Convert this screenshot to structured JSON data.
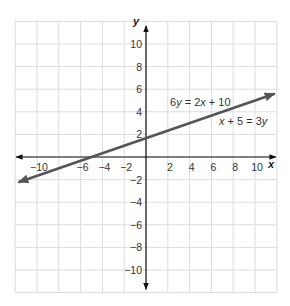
{
  "chart_data": {
    "type": "line",
    "title": "",
    "xlabel": "x",
    "ylabel": "y",
    "xlim": [
      -12,
      12
    ],
    "ylim": [
      -12,
      12
    ],
    "grid": true,
    "grid_step": 2,
    "x_ticks": [
      -10,
      -6,
      -4,
      -2,
      2,
      4,
      6,
      8,
      10
    ],
    "x_tick_labels": [
      "−10",
      "−6",
      "−4",
      "−2",
      "2",
      "4",
      "6",
      "8",
      "10"
    ],
    "y_ticks": [
      10,
      8,
      6,
      4,
      2,
      -2,
      -4,
      -6,
      -8,
      -10
    ],
    "y_tick_labels": [
      "10",
      "8",
      "6",
      "4",
      "2",
      "−2",
      "−4",
      "−6",
      "−8",
      "−10"
    ],
    "series": [
      {
        "name": "6y = 2x + 10 / x + 5 = 3y",
        "equation": "y = (x + 5) / 3",
        "slope": 0.3333,
        "intercept": 1.6667,
        "x": [
          -11.7,
          -5,
          0,
          11.8
        ],
        "y": [
          -2.23,
          0,
          1.67,
          5.6
        ],
        "arrows": "both",
        "color": "#555555"
      }
    ],
    "annotations": [
      {
        "text_parts": [
          "6",
          "y",
          " = 2",
          "x",
          " + 10"
        ],
        "italic": [
          false,
          true,
          false,
          true,
          false
        ],
        "x": 170,
        "y": 106
      },
      {
        "text_parts": [
          "x",
          " + 5 = 3",
          "y"
        ],
        "italic": [
          true,
          false,
          true
        ],
        "x": 219,
        "y": 125
      }
    ]
  },
  "style": {
    "grid_color": "#dcdcdc",
    "axis_color": "#111111",
    "line_color": "#555555"
  },
  "labels": {
    "x_axis": "x",
    "y_axis": "y",
    "eq1": {
      "a": "6",
      "b": "y",
      "c": " = 2",
      "d": "x",
      "e": " + 10"
    },
    "eq2": {
      "a": "x",
      "b": " + 5 = 3",
      "c": "y"
    }
  }
}
